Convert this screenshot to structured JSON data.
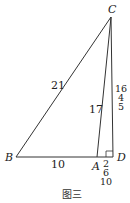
{
  "figure": {
    "caption": "图三",
    "points": {
      "A": {
        "label": "A",
        "x": 97,
        "y": 157
      },
      "B": {
        "label": "B",
        "x": 16,
        "y": 157
      },
      "C": {
        "label": "C",
        "x": 111,
        "y": 17
      },
      "D": {
        "label": "D",
        "x": 113,
        "y": 157
      }
    },
    "segments": {
      "BC": {
        "label": "21"
      },
      "AC": {
        "label": "17"
      },
      "BA": {
        "label": "10"
      },
      "CD": {
        "label_lines": [
          "16",
          "4",
          "5"
        ]
      },
      "AD": {
        "label_lines": [
          "2",
          "6",
          "10"
        ]
      }
    },
    "right_angle_at": "D",
    "stroke_color": "#333333"
  }
}
